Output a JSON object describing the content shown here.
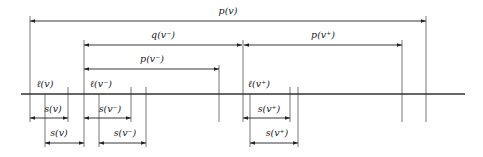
{
  "figure": {
    "type": "interval-diagram",
    "axis": {
      "x1": 21,
      "x2": 465,
      "y": 94
    },
    "vertical_lines": [
      {
        "x": 30,
        "y1": 16,
        "y2": 122
      },
      {
        "x": 45,
        "y1": 94,
        "y2": 147
      },
      {
        "x": 68,
        "y1": 87,
        "y2": 122
      },
      {
        "x": 84,
        "y1": 40,
        "y2": 147
      },
      {
        "x": 99,
        "y1": 94,
        "y2": 147
      },
      {
        "x": 131,
        "y1": 87,
        "y2": 122
      },
      {
        "x": 146,
        "y1": 87,
        "y2": 147
      },
      {
        "x": 219,
        "y1": 65,
        "y2": 122
      },
      {
        "x": 243,
        "y1": 40,
        "y2": 122
      },
      {
        "x": 250,
        "y1": 94,
        "y2": 147
      },
      {
        "x": 290,
        "y1": 87,
        "y2": 122
      },
      {
        "x": 298,
        "y1": 87,
        "y2": 147
      },
      {
        "x": 402,
        "y1": 40,
        "y2": 122
      },
      {
        "x": 426,
        "y1": 16,
        "y2": 122
      }
    ],
    "arrows": [
      {
        "name": "p-v",
        "x1": 30,
        "x2": 426,
        "y": 21,
        "label": "p(v)",
        "label_x": 228,
        "label_y": 14
      },
      {
        "name": "q-v-minus",
        "x1": 84,
        "x2": 242,
        "y": 45,
        "label": "q(v⁻)",
        "label_x": 163,
        "label_y": 38
      },
      {
        "name": "p-v-plus",
        "x1": 244,
        "x2": 402,
        "y": 45,
        "label": "p(v⁺)",
        "label_x": 323,
        "label_y": 38
      },
      {
        "name": "p-v-minus",
        "x1": 84,
        "x2": 219,
        "y": 69,
        "label": "p(v⁻)",
        "label_x": 152,
        "label_y": 62
      },
      {
        "name": "s-v-row1",
        "x1": 30,
        "x2": 68,
        "y": 118,
        "label": "s(v)",
        "label_x": 53,
        "label_y": 112
      },
      {
        "name": "s-v-minus-row1",
        "x1": 84,
        "x2": 131,
        "y": 118,
        "label": "s(v⁻)",
        "label_x": 110,
        "label_y": 112
      },
      {
        "name": "s-v-plus-row1",
        "x1": 243,
        "x2": 290,
        "y": 118,
        "label": "s(v⁺)",
        "label_x": 269,
        "label_y": 112
      },
      {
        "name": "s-v-row2",
        "x1": 45,
        "x2": 84,
        "y": 143,
        "label": "s(v)",
        "label_x": 59,
        "label_y": 136
      },
      {
        "name": "s-v-minus-row2",
        "x1": 99,
        "x2": 146,
        "y": 143,
        "label": "s(v⁻)",
        "label_x": 125,
        "label_y": 136
      },
      {
        "name": "s-v-plus-row2",
        "x1": 250,
        "x2": 298,
        "y": 143,
        "label": "s(v⁺)",
        "label_x": 277,
        "label_y": 136
      }
    ],
    "point_labels": [
      {
        "name": "l-v",
        "text": "ℓ(v)",
        "x": 45,
        "y": 87
      },
      {
        "name": "l-v-minus",
        "text": "ℓ(v⁻)",
        "x": 101,
        "y": 87
      },
      {
        "name": "l-v-plus",
        "text": "ℓ(v⁺)",
        "x": 259,
        "y": 87
      }
    ]
  },
  "labels": {
    "p_v": "p(v)",
    "q_v_minus": "q(v⁻)",
    "p_v_plus": "p(v⁺)",
    "p_v_minus": "p(v⁻)",
    "l_v": "ℓ(v)",
    "l_v_minus": "ℓ(v⁻)",
    "l_v_plus": "ℓ(v⁺)",
    "s_v": "s(v)",
    "s_v_minus": "s(v⁻)",
    "s_v_plus": "s(v⁺)"
  }
}
